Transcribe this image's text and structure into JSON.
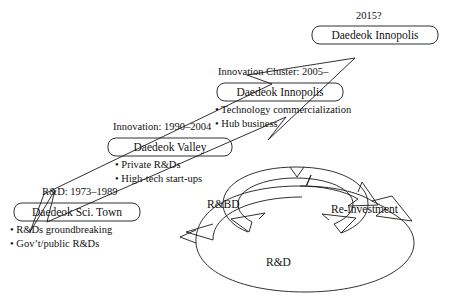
{
  "diagram": {
    "stroke_color": "#1a1a1a",
    "background_color": "#ffffff"
  },
  "stages": [
    {
      "id": "stage-sci-town",
      "era_label": "R&D: 1973–1989",
      "box_label": "Daedeok Sci. Town",
      "bullets": [
        "• R&Ds groundbreaking",
        "• Gov’t/public R&Ds"
      ]
    },
    {
      "id": "stage-valley",
      "era_label": "Innovation: 1990–2004",
      "box_label": "Daedeok Valley",
      "bullets": [
        "• Private R&Ds",
        "• High-tech start-ups"
      ]
    },
    {
      "id": "stage-innopolis",
      "era_label": "Innovation Cluster: 2005–",
      "box_label": "Daedeok Innopolis",
      "bullets": [
        "• Technology commercialization",
        "• Hub business"
      ]
    },
    {
      "id": "stage-future",
      "era_label": "2015?",
      "box_label": "Daedeok Innopolis",
      "bullets": []
    }
  ],
  "cycle": {
    "outer_label": "R&D",
    "inner_label": "R&BD",
    "return_label": "Re-investment"
  }
}
